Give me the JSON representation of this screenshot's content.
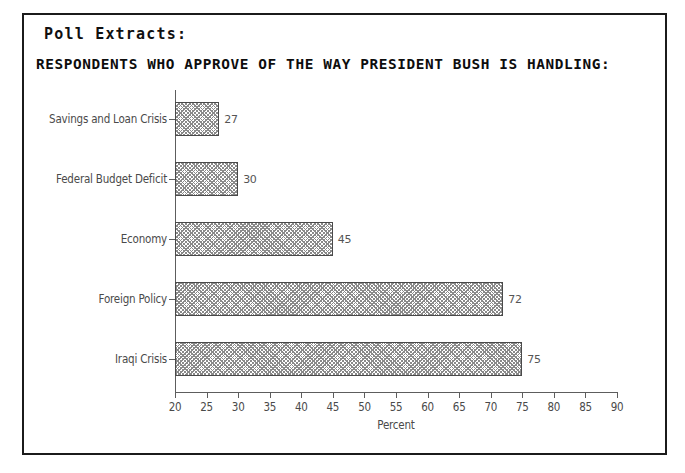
{
  "document": {
    "section_heading": "Poll Extracts:",
    "chart_title": "RESPONDENTS WHO APPROVE OF THE WAY PRESIDENT BUSH IS HANDLING:"
  },
  "colors": {
    "frame_border": "#1b1b1b",
    "axis": "#5d5d5d",
    "bar_edge": "#4a4a4a",
    "bar_fill": "#8a8a8a",
    "label_text": "#4a4a4a",
    "heading_text": "#101010",
    "background": "#ffffff"
  },
  "chart_data": {
    "type": "bar",
    "orientation": "horizontal",
    "title": "RESPONDENTS WHO APPROVE OF THE WAY PRESIDENT BUSH IS HANDLING:",
    "xlabel": "Percent",
    "ylabel": "",
    "xlim": [
      20,
      90
    ],
    "xticks": [
      20,
      25,
      30,
      35,
      40,
      45,
      50,
      55,
      60,
      65,
      70,
      75,
      80,
      85,
      90
    ],
    "xtick_labels": [
      "20",
      "25",
      "30",
      "35",
      "40",
      "45",
      "50",
      "55",
      "60",
      "65",
      "70",
      "75",
      "80",
      "85",
      "90"
    ],
    "grid": false,
    "legend": false,
    "data_labels": true,
    "categories": [
      "Savings and Loan Crisis",
      "Federal Budget Deficit",
      "Economy",
      "Foreign Policy",
      "Iraqi Crisis"
    ],
    "values": [
      27,
      30,
      45,
      72,
      75
    ],
    "value_labels": [
      "27",
      "30",
      "45",
      "72",
      "75"
    ]
  }
}
